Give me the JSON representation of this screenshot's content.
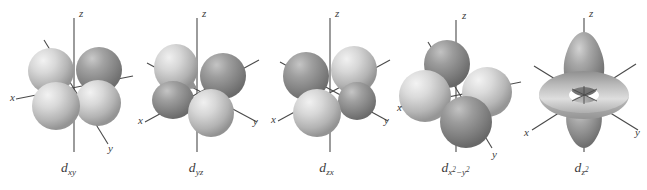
{
  "figure": {
    "background_color": "#ffffff",
    "axis_color": "#4a4a4a",
    "lobe_light_color": "#c8c8c8",
    "lobe_dark_color": "#8c8c8c",
    "label_color": "#3a3a3a",
    "panel_count": 5
  },
  "axes": {
    "x_label": "x",
    "y_label": "y",
    "z_label": "z"
  },
  "orbitals": [
    {
      "id": "dxy",
      "label_base": "d",
      "label_sub": "xy",
      "label_sub_sup": "",
      "label_text": "dxy",
      "panel_left": 2,
      "panel_width": 133,
      "label_top": 160,
      "shape": "four-lobe-clover",
      "lobe_form": "sphere",
      "plane": "xy",
      "lobe_radius": 23,
      "lobe_offset": 26,
      "lobe_angles": [
        155,
        205,
        25,
        335
      ],
      "lobe_shades": [
        "light",
        "light",
        "dark",
        "light"
      ],
      "center_x": 72,
      "center_y": 88,
      "axis_x_label_pos": {
        "x": 8,
        "y": 101
      },
      "axis_y_label_pos": {
        "x": 108,
        "y": 152
      },
      "axis_z_label_pos": {
        "x": 78,
        "y": 17
      }
    },
    {
      "id": "dyz",
      "label_base": "d",
      "label_sub": "yz",
      "label_sub_sup": "",
      "label_text": "dyz",
      "panel_left": 131,
      "panel_width": 130,
      "label_top": 160,
      "shape": "four-lobe-clover",
      "lobe_form": "teardrop",
      "plane": "yz",
      "lobe_radius": 22,
      "lobe_offset": 26,
      "lobe_angles": [
        145,
        215,
        35,
        325
      ],
      "lobe_shades": [
        "light",
        "dark",
        "dark",
        "light"
      ],
      "center_x": 66,
      "center_y": 88,
      "axis_x_label_pos": {
        "x": 9,
        "y": 123
      },
      "axis_y_label_pos": {
        "x": 124,
        "y": 124
      },
      "axis_z_label_pos": {
        "x": 72,
        "y": 17
      }
    },
    {
      "id": "dzx",
      "label_base": "d",
      "label_sub": "zx",
      "label_sub_sup": "",
      "label_text": "dzx",
      "panel_left": 260,
      "panel_width": 133,
      "label_top": 160,
      "shape": "four-lobe-clover",
      "lobe_form": "teardrop",
      "plane": "zx",
      "lobe_radius": 22,
      "lobe_offset": 26,
      "lobe_angles": [
        150,
        210,
        30,
        330
      ],
      "lobe_shades": [
        "dark",
        "light",
        "light",
        "dark"
      ],
      "center_x": 70,
      "center_y": 88,
      "axis_x_label_pos": {
        "x": 13,
        "y": 122
      },
      "axis_y_label_pos": {
        "x": 126,
        "y": 124
      },
      "axis_z_label_pos": {
        "x": 76,
        "y": 17
      }
    },
    {
      "id": "dx2-y2",
      "label_base": "d",
      "label_sub": "x",
      "label_sub_sup": "2",
      "label_text": "dx2-y2",
      "panel_left": 388,
      "panel_width": 135,
      "label_top": 160,
      "shape": "four-lobe-along-axes",
      "lobe_form": "sphere",
      "plane": "xy",
      "lobe_radius": 25,
      "lobe_offset": 27,
      "lobe_angles": [
        180,
        120,
        0,
        300
      ],
      "lobe_shades": [
        "light",
        "dark",
        "light",
        "dark"
      ],
      "center_x": 68,
      "center_y": 92,
      "axis_x_label_pos": {
        "x": 10,
        "y": 110
      },
      "axis_y_label_pos": {
        "x": 108,
        "y": 158
      },
      "axis_z_label_pos": {
        "x": 76,
        "y": 18
      }
    },
    {
      "id": "dz2",
      "label_base": "d",
      "label_sub": "z",
      "label_sub_sup": "2",
      "label_text": "dz2",
      "panel_left": 516,
      "panel_width": 131,
      "label_top": 160,
      "shape": "two-lobe-with-torus",
      "lobe_form": "pear",
      "plane": "z",
      "torus_outer_rx": 45,
      "torus_outer_ry": 24,
      "torus_inner_rx": 15,
      "torus_inner_ry": 8,
      "center_x": 68,
      "center_y": 95,
      "axis_x_label_pos": {
        "x": 11,
        "y": 135
      },
      "axis_y_label_pos": {
        "x": 120,
        "y": 135
      },
      "axis_z_label_pos": {
        "x": 74,
        "y": 17
      }
    }
  ]
}
